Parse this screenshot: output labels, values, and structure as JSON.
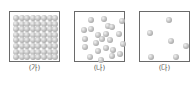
{
  "panels": [
    {
      "label": "(가)",
      "state": "solid",
      "x": 9,
      "grid": {
        "rows": 8,
        "cols": 8,
        "origin": [
          3,
          3
        ],
        "spacing": 5.6
      }
    },
    {
      "label": "(나)",
      "state": "liquid",
      "x": 74,
      "particles": [
        [
          14,
          6
        ],
        [
          27,
          5
        ],
        [
          45,
          7
        ],
        [
          7,
          16
        ],
        [
          14,
          15
        ],
        [
          31,
          12
        ],
        [
          35,
          13
        ],
        [
          21,
          21
        ],
        [
          29,
          20
        ],
        [
          42,
          20
        ],
        [
          8,
          25
        ],
        [
          25,
          25
        ],
        [
          19,
          29
        ],
        [
          33,
          26
        ],
        [
          46,
          30
        ],
        [
          8,
          33
        ],
        [
          21,
          37
        ],
        [
          29,
          34
        ],
        [
          36,
          36
        ],
        [
          43,
          40
        ],
        [
          13,
          43
        ],
        [
          24,
          46
        ],
        [
          35,
          42
        ]
      ]
    },
    {
      "label": "(다)",
      "state": "gas",
      "x": 139,
      "particles": [
        [
          27,
          6
        ],
        [
          8,
          19
        ],
        [
          29,
          27
        ],
        [
          44,
          32
        ],
        [
          9,
          43
        ],
        [
          34,
          43
        ]
      ]
    }
  ],
  "colors": {
    "border": "#6a6a6a",
    "particle": "#b5b5b5",
    "label": "#555555"
  }
}
